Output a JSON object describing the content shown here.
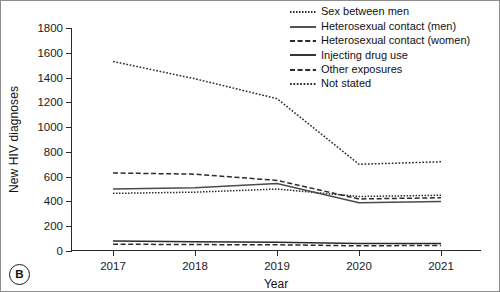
{
  "panel": {
    "tag": "B"
  },
  "chart_data": {
    "type": "line",
    "title": "",
    "xlabel": "Year",
    "ylabel": "New HIV diagnoses",
    "x": [
      2017,
      2018,
      2019,
      2020,
      2021
    ],
    "xtick_labels": [
      "2017",
      "2018",
      "2019",
      "2020",
      "2021"
    ],
    "ytick_labels": [
      "0",
      "200",
      "400",
      "600",
      "800",
      "1000",
      "1200",
      "1400",
      "1600",
      "1800"
    ],
    "yticks": [
      0,
      200,
      400,
      600,
      800,
      1000,
      1200,
      1400,
      1600,
      1800
    ],
    "ylim": [
      0,
      1800
    ],
    "xlim": [
      2016.5,
      2021.5
    ],
    "grid": false,
    "legend_position": "top-right",
    "series": [
      {
        "name": "Sex between men",
        "style": "dotted-fine",
        "color": "#2b2b2b",
        "values": [
          465,
          475,
          500,
          440,
          450
        ]
      },
      {
        "name": "Heterosexual contact (men)",
        "style": "solid",
        "color": "#4a4a4a",
        "values": [
          500,
          510,
          545,
          390,
          400
        ]
      },
      {
        "name": "Heterosexual contact (women)",
        "style": "dashed",
        "color": "#2b2b2b",
        "values": [
          630,
          620,
          570,
          420,
          430
        ]
      },
      {
        "name": "Injecting drug use",
        "style": "solid",
        "color": "#2b2b2b",
        "values": [
          80,
          75,
          70,
          60,
          60
        ]
      },
      {
        "name": "Other exposures",
        "style": "dashed",
        "color": "#2b2b2b",
        "values": [
          55,
          52,
          50,
          42,
          45
        ]
      },
      {
        "name": "Not stated",
        "style": "dotted",
        "color": "#2b2b2b",
        "values": [
          1530,
          1390,
          1230,
          700,
          720
        ]
      }
    ]
  }
}
